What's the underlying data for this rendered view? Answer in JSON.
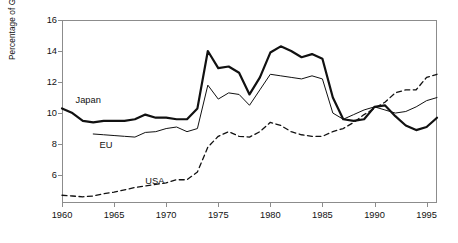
{
  "chart_data": {
    "type": "line",
    "title": "",
    "xlabel": "",
    "ylabel": "Percentage of GDP (current prices)",
    "xlim": [
      1960,
      1996
    ],
    "ylim": [
      4.2,
      16
    ],
    "yticks": [
      6,
      8,
      10,
      12,
      14,
      16
    ],
    "xticks": [
      1960,
      1965,
      1970,
      1975,
      1980,
      1985,
      1990,
      1995
    ],
    "grid": false,
    "legend_position": "inline-annotations",
    "annotations": [
      {
        "text": "Japan",
        "x": 1961.3,
        "y": 10.75
      },
      {
        "text": "EU",
        "x": 1963.6,
        "y": 7.85
      },
      {
        "text": "USA",
        "x": 1968.0,
        "y": 5.55
      }
    ],
    "series": [
      {
        "name": "Japan",
        "style": "solid-thick",
        "color": "#111111",
        "x": [
          1960,
          1961,
          1962,
          1963,
          1964,
          1965,
          1966,
          1967,
          1968,
          1969,
          1970,
          1971,
          1972,
          1973,
          1974,
          1975,
          1976,
          1977,
          1978,
          1979,
          1980,
          1981,
          1982,
          1983,
          1984,
          1985,
          1986,
          1987,
          1988,
          1989,
          1990,
          1991,
          1992,
          1993,
          1994,
          1995,
          1996
        ],
        "values": [
          10.3,
          10.0,
          9.5,
          9.4,
          9.5,
          9.5,
          9.5,
          9.6,
          9.9,
          9.7,
          9.7,
          9.6,
          9.6,
          10.3,
          14.0,
          12.9,
          13.0,
          12.6,
          11.2,
          12.3,
          13.9,
          14.3,
          14.0,
          13.6,
          13.8,
          13.5,
          11.0,
          9.6,
          9.5,
          9.6,
          10.4,
          10.5,
          9.8,
          9.2,
          8.9,
          9.1,
          9.7
        ]
      },
      {
        "name": "EU",
        "style": "solid-thin",
        "color": "#111111",
        "x": [
          1963,
          1964,
          1965,
          1966,
          1967,
          1968,
          1969,
          1970,
          1971,
          1972,
          1973,
          1974,
          1975,
          1976,
          1977,
          1978,
          1979,
          1980,
          1981,
          1982,
          1983,
          1984,
          1985,
          1986,
          1987,
          1988,
          1989,
          1990,
          1991,
          1992,
          1993,
          1994,
          1995,
          1996
        ],
        "values": [
          8.65,
          8.6,
          8.55,
          8.5,
          8.45,
          8.75,
          8.8,
          9.0,
          9.1,
          8.8,
          9.0,
          11.8,
          10.9,
          11.3,
          11.2,
          10.5,
          11.5,
          12.5,
          12.4,
          12.3,
          12.2,
          12.4,
          12.2,
          10.0,
          9.6,
          9.9,
          10.2,
          10.4,
          10.2,
          10.0,
          10.1,
          10.4,
          10.8,
          11.0
        ]
      },
      {
        "name": "USA",
        "style": "dashed",
        "color": "#111111",
        "x": [
          1960,
          1961,
          1962,
          1963,
          1964,
          1965,
          1966,
          1967,
          1968,
          1969,
          1970,
          1971,
          1972,
          1973,
          1974,
          1975,
          1976,
          1977,
          1978,
          1979,
          1980,
          1981,
          1982,
          1983,
          1984,
          1985,
          1986,
          1987,
          1988,
          1989,
          1990,
          1991,
          1992,
          1993,
          1994,
          1995,
          1996
        ],
        "values": [
          4.7,
          4.65,
          4.6,
          4.65,
          4.8,
          4.9,
          5.05,
          5.2,
          5.3,
          5.4,
          5.5,
          5.7,
          5.7,
          6.2,
          7.8,
          8.5,
          8.8,
          8.5,
          8.45,
          8.8,
          9.4,
          9.2,
          8.8,
          8.6,
          8.5,
          8.5,
          8.8,
          9.0,
          9.4,
          9.9,
          10.3,
          10.7,
          11.3,
          11.5,
          11.5,
          12.3,
          12.5
        ]
      }
    ]
  }
}
